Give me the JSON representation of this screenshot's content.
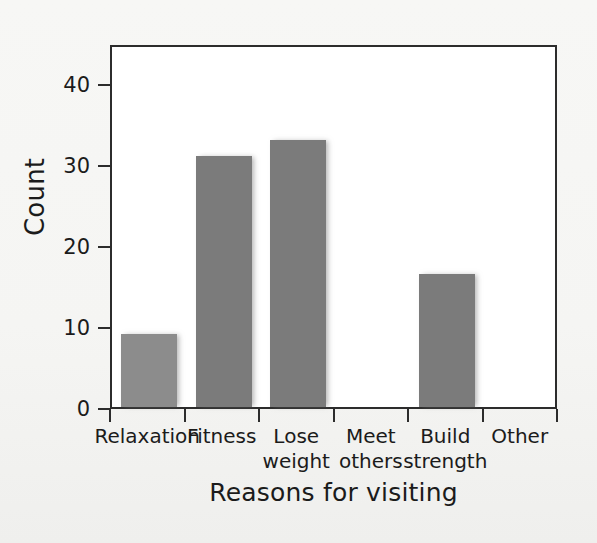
{
  "chart_data": {
    "type": "bar",
    "title": "",
    "xlabel": "Reasons for visiting",
    "ylabel": "Count",
    "categories": [
      "Relaxation",
      "Fitness",
      "Lose weight",
      "Meet others",
      "Build strength",
      "Other"
    ],
    "category_lines": [
      [
        "Relaxation",
        ""
      ],
      [
        "Fitness",
        ""
      ],
      [
        "Lose",
        "weight"
      ],
      [
        "Meet",
        "others"
      ],
      [
        "Build",
        "strength"
      ],
      [
        "Other",
        ""
      ]
    ],
    "values": [
      9,
      31,
      33,
      0,
      16.5,
      0
    ],
    "ylim": [
      0,
      45
    ],
    "yticks": [
      0,
      10,
      20,
      30,
      40
    ],
    "ytick_labels": [
      "0",
      "10",
      "20",
      "30",
      "40"
    ],
    "grid": false,
    "legend": null,
    "bar_color": "#7b7b7b",
    "bar_color_first": "#8c8c8c",
    "frame_color": "#2c2c2c",
    "plot_background": "#ffffff",
    "figure_background": "#f6f6f4"
  }
}
